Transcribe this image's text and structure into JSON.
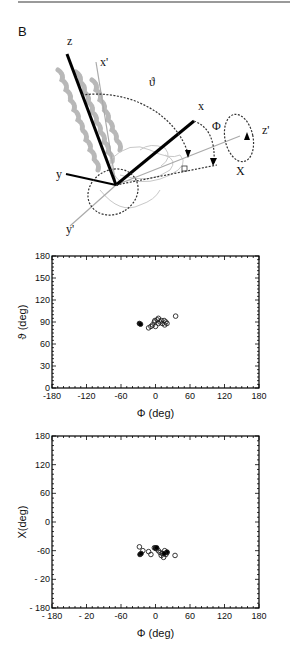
{
  "panel_label": "B",
  "diagram": {
    "axis_labels": {
      "z": "z",
      "x_prime": "x'",
      "x": "x",
      "y": "y",
      "y_prime": "y'",
      "z_prime": "z'"
    },
    "angle_labels": {
      "theta": "ϑ",
      "phi": "Φ",
      "chi": "X"
    }
  },
  "chart_data": [
    {
      "type": "scatter",
      "title": "",
      "xlabel": "Φ (deg)",
      "ylabel": "ϑ (deg)",
      "xlim": [
        -180,
        180
      ],
      "ylim": [
        0,
        180
      ],
      "xticks": [
        "-180",
        "-120",
        "-60",
        "0",
        "60",
        "120",
        "180"
      ],
      "yticks": [
        "0",
        "30",
        "60",
        "90",
        "120",
        "150",
        "180"
      ],
      "grid": false,
      "series": [
        {
          "name": "open",
          "marker": "open-circle",
          "points": [
            [
              -12,
              82
            ],
            [
              -8,
              84
            ],
            [
              -5,
              86
            ],
            [
              -2,
              90
            ],
            [
              0,
              84
            ],
            [
              3,
              93
            ],
            [
              5,
              88
            ],
            [
              8,
              90
            ],
            [
              10,
              92
            ],
            [
              12,
              88
            ],
            [
              15,
              92
            ],
            [
              16,
              86
            ],
            [
              18,
              90
            ],
            [
              20,
              88
            ],
            [
              35,
              98
            ],
            [
              5,
              95
            ],
            [
              -1,
              92
            ]
          ]
        },
        {
          "name": "filled",
          "marker": "filled-circle",
          "points": [
            [
              -28,
              88
            ],
            [
              -26,
              87
            ]
          ]
        }
      ]
    },
    {
      "type": "scatter",
      "title": "",
      "xlabel": "Φ (deg)",
      "ylabel": "X(deg)",
      "xlim": [
        -180,
        180
      ],
      "ylim": [
        -180,
        180
      ],
      "xticks": [
        "- 180",
        "- 20",
        "-60",
        "0",
        "60",
        "120",
        "180"
      ],
      "yticks": [
        "- 180",
        "- 20",
        "-60",
        "0",
        "60",
        "120",
        "180"
      ],
      "grid": false,
      "series": [
        {
          "name": "open",
          "marker": "open-circle",
          "points": [
            [
              -28,
              -52
            ],
            [
              -22,
              -60
            ],
            [
              -12,
              -62
            ],
            [
              -8,
              -68
            ],
            [
              0,
              -54
            ],
            [
              5,
              -60
            ],
            [
              8,
              -64
            ],
            [
              10,
              -70
            ],
            [
              12,
              -66
            ],
            [
              14,
              -74
            ],
            [
              16,
              -60
            ],
            [
              18,
              -68
            ],
            [
              20,
              -64
            ],
            [
              34,
              -70
            ],
            [
              2,
              -56
            ],
            [
              -2,
              -54
            ]
          ]
        },
        {
          "name": "filled",
          "marker": "filled-circle",
          "points": [
            [
              -27,
              -68
            ],
            [
              -25,
              -66
            ],
            [
              0,
              -55
            ],
            [
              2,
              -54
            ],
            [
              20,
              -63
            ],
            [
              15,
              -66
            ]
          ]
        }
      ]
    }
  ]
}
